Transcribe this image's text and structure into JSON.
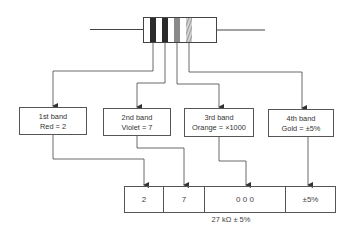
{
  "resistor": {
    "bands": [
      {
        "name": "band-1",
        "color": "#2b2b2b"
      },
      {
        "name": "band-2",
        "color": "#2b2b2b"
      },
      {
        "name": "band-3",
        "color": "#8a8a8a"
      },
      {
        "name": "band-4",
        "color": "#c8c8c8"
      }
    ]
  },
  "band_boxes": [
    {
      "title": "1st band",
      "value": "Red = 2"
    },
    {
      "title": "2nd band",
      "value": "Violet = 7"
    },
    {
      "title": "3rd band",
      "value": "Orange = ×1000"
    },
    {
      "title": "4th band",
      "value": "Gold = ±5%"
    }
  ],
  "result": {
    "cells": [
      "2",
      "7",
      "0 0 0",
      "±5%"
    ],
    "caption": "27 kΩ ± 5%"
  }
}
